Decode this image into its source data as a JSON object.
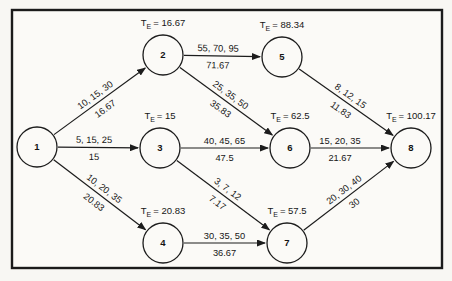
{
  "diagram": {
    "type": "pert-network",
    "te_prefix": "T",
    "te_sub": "E",
    "node_radius": 20,
    "frame": {
      "x": 12,
      "y": 10,
      "w": 430,
      "h": 258
    },
    "colors": {
      "line": "#1c1c1c",
      "paper": "#fbfaf7",
      "text": "#161616"
    },
    "nodes": [
      {
        "id": "1",
        "label": "1",
        "x": 37,
        "y": 147
      },
      {
        "id": "2",
        "label": "2",
        "x": 163,
        "y": 55,
        "te": "16.67"
      },
      {
        "id": "3",
        "label": "3",
        "x": 160,
        "y": 148,
        "te": "15"
      },
      {
        "id": "4",
        "label": "4",
        "x": 163,
        "y": 243,
        "te": "20.83"
      },
      {
        "id": "5",
        "label": "5",
        "x": 282,
        "y": 57,
        "te": "88.34"
      },
      {
        "id": "6",
        "label": "6",
        "x": 290,
        "y": 148,
        "te": "62.5"
      },
      {
        "id": "7",
        "label": "7",
        "x": 287,
        "y": 243,
        "te": "57.5"
      },
      {
        "id": "8",
        "label": "8",
        "x": 411,
        "y": 148,
        "te": "100.17"
      }
    ],
    "edges": [
      {
        "from": "1",
        "to": "2",
        "estimates": "10, 15, 30",
        "expected": "16.67"
      },
      {
        "from": "1",
        "to": "3",
        "estimates": "5, 15, 25",
        "expected": "15"
      },
      {
        "from": "1",
        "to": "4",
        "estimates": "10, 20, 35",
        "expected": "20.83"
      },
      {
        "from": "2",
        "to": "5",
        "estimates": "55, 70, 95",
        "expected": "71.67"
      },
      {
        "from": "2",
        "to": "6",
        "estimates": "25, 35, 50",
        "expected": "35.83"
      },
      {
        "from": "3",
        "to": "6",
        "estimates": "40, 45, 65",
        "expected": "47.5"
      },
      {
        "from": "3",
        "to": "7",
        "estimates": "3, 7, 12",
        "expected": "7.17"
      },
      {
        "from": "4",
        "to": "7",
        "estimates": "30, 35, 50",
        "expected": "36.67"
      },
      {
        "from": "5",
        "to": "8",
        "estimates": "8, 12, 15",
        "expected": "11.83"
      },
      {
        "from": "6",
        "to": "8",
        "estimates": "15, 20, 35",
        "expected": "21.67"
      },
      {
        "from": "7",
        "to": "8",
        "estimates": "20, 30, 40",
        "expected": "30"
      }
    ]
  }
}
